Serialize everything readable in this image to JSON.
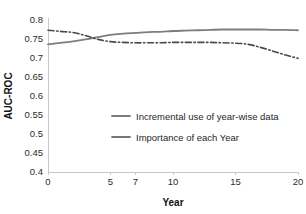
{
  "chart_data": {
    "type": "line",
    "title": "",
    "xlabel": "Year",
    "ylabel": "AUC-ROC",
    "xlim": [
      0,
      20
    ],
    "ylim": [
      0.4,
      0.8
    ],
    "grid": false,
    "legend_position": "center",
    "x_ticks": [
      0,
      5,
      7,
      10,
      15,
      20
    ],
    "x_tick_labels": [
      "0",
      "5",
      "7",
      "10",
      "15",
      "20"
    ],
    "y_ticks": [
      0.4,
      0.45,
      0.5,
      0.55,
      0.6,
      0.65,
      0.7,
      0.75,
      0.8
    ],
    "y_tick_labels": [
      "0.4",
      "0.45",
      "0.5",
      "0.55",
      "0.6",
      "0.65",
      "0.7",
      "0.75",
      "0.8"
    ],
    "x": [
      0,
      1,
      2,
      3,
      4,
      5,
      6,
      7,
      8,
      9,
      10,
      11,
      12,
      13,
      14,
      15,
      16,
      17,
      18,
      19,
      20
    ],
    "series": [
      {
        "name": "Incremental use of year-wise data",
        "style": "solid",
        "color": "#7d7d7d",
        "width": 1.8,
        "values": [
          0.736,
          0.74,
          0.744,
          0.749,
          0.755,
          0.761,
          0.764,
          0.766,
          0.768,
          0.769,
          0.771,
          0.772,
          0.773,
          0.774,
          0.775,
          0.775,
          0.775,
          0.775,
          0.774,
          0.774,
          0.773
        ]
      },
      {
        "name": "Importance of each Year",
        "style": "dashdot",
        "color": "#4a4a4a",
        "width": 1.6,
        "values": [
          0.773,
          0.77,
          0.767,
          0.759,
          0.749,
          0.743,
          0.741,
          0.74,
          0.74,
          0.74,
          0.741,
          0.741,
          0.741,
          0.741,
          0.74,
          0.739,
          0.736,
          0.728,
          0.718,
          0.708,
          0.699
        ]
      }
    ],
    "legend": [
      {
        "label": "Incremental use of year-wise data",
        "style": "solid",
        "color": "#7d7d7d"
      },
      {
        "label": "Importance of each Year",
        "style": "dashdot",
        "color": "#4a4a4a"
      }
    ],
    "plot_area": {
      "left": 48,
      "top": 20,
      "right": 298,
      "bottom": 172
    },
    "axis_color": "#c8c8c8"
  }
}
